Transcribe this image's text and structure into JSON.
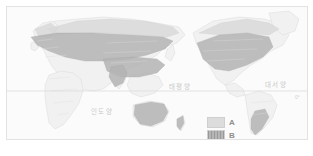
{
  "figure": {
    "type": "world-distribution-map",
    "equator_label": "0°"
  },
  "ocean_labels": [
    {
      "id": "pacific",
      "text": "태평양"
    },
    {
      "id": "atlantic",
      "text": "대서양"
    },
    {
      "id": "indian",
      "text": "인도양"
    }
  ],
  "legend": {
    "items": [
      {
        "key": "A",
        "label": "A",
        "color": "#dcdcdc",
        "pattern": "solid-light"
      },
      {
        "key": "B",
        "label": "B",
        "color": "#b6b6b6",
        "pattern": "hatched-dark"
      }
    ]
  },
  "map_regions": {
    "A": {
      "description": "lighter shaded distribution zone",
      "areas": [
        "Northern Europe",
        "Northern Asia",
        "Northern North America"
      ]
    },
    "B": {
      "description": "darker shaded distribution zone",
      "areas": [
        "Europe",
        "Central and East Asia",
        "South Asia",
        "United States",
        "Australia",
        "Southern South America"
      ]
    }
  },
  "colors": {
    "land": "#f1f1f1",
    "ocean": "#fbfbfb",
    "border": "#dcdcdc",
    "region_a": "#dadada",
    "region_b": "#b4b4b4",
    "label_text": "#c9c9c9",
    "legend_text": "#8e8e8e"
  }
}
